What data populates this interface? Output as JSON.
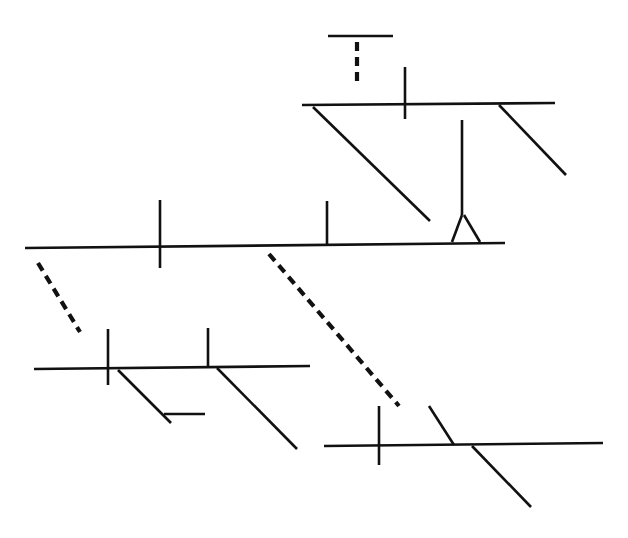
{
  "diagram": {
    "type": "sentence-diagram (Reed-Kellogg style, unlabeled)",
    "stroke_color": "#111111",
    "background": "#ffffff",
    "labels_visible": false,
    "segments": [
      {
        "id": "appositive-top-line",
        "style": "solid",
        "x1": 328,
        "y1": 36,
        "x2": 393,
        "y2": 36
      },
      {
        "id": "appositive-connector",
        "style": "dashed",
        "x1": 357,
        "y1": 42,
        "x2": 357,
        "y2": 84
      },
      {
        "id": "upper-clause-baseline",
        "style": "solid",
        "x1": 302,
        "y1": 105,
        "x2": 555,
        "y2": 103
      },
      {
        "id": "upper-clause-divider",
        "style": "solid",
        "x1": 405,
        "y1": 67,
        "x2": 405,
        "y2": 119
      },
      {
        "id": "upper-clause-modifier-left",
        "style": "solid",
        "x1": 313,
        "y1": 107,
        "x2": 430,
        "y2": 221
      },
      {
        "id": "upper-clause-modifier-right",
        "style": "solid",
        "x1": 499,
        "y1": 105,
        "x2": 566,
        "y2": 175
      },
      {
        "id": "pedestal-stem",
        "style": "solid",
        "x1": 462,
        "y1": 120,
        "x2": 462,
        "y2": 215
      },
      {
        "id": "pedestal-leg-left",
        "style": "solid",
        "x1": 462,
        "y1": 215,
        "x2": 452,
        "y2": 242
      },
      {
        "id": "pedestal-leg-right",
        "style": "solid",
        "x1": 464,
        "y1": 215,
        "x2": 480,
        "y2": 242
      },
      {
        "id": "main-baseline",
        "style": "solid",
        "x1": 25,
        "y1": 248,
        "x2": 505,
        "y2": 243
      },
      {
        "id": "main-subject-verb-divider",
        "style": "solid",
        "x1": 160,
        "y1": 200,
        "x2": 160,
        "y2": 268
      },
      {
        "id": "main-verb-complement-divider",
        "style": "solid",
        "x1": 327,
        "y1": 201,
        "x2": 327,
        "y2": 245
      },
      {
        "id": "connector-left",
        "style": "dashed",
        "x1": 38,
        "y1": 263,
        "x2": 80,
        "y2": 332
      },
      {
        "id": "connector-center",
        "style": "dashed",
        "x1": 269,
        "y1": 254,
        "x2": 399,
        "y2": 406
      },
      {
        "id": "lower-left-baseline",
        "style": "solid",
        "x1": 34,
        "y1": 369,
        "x2": 310,
        "y2": 366
      },
      {
        "id": "lower-left-subject-verb-divider",
        "style": "solid",
        "x1": 108,
        "y1": 329,
        "x2": 108,
        "y2": 385
      },
      {
        "id": "lower-left-verb-complement-divider",
        "style": "solid",
        "x1": 208,
        "y1": 328,
        "x2": 208,
        "y2": 367
      },
      {
        "id": "lower-left-modifier-a",
        "style": "solid",
        "x1": 118,
        "y1": 370,
        "x2": 171,
        "y2": 423
      },
      {
        "id": "lower-left-modifier-a-object",
        "style": "solid",
        "x1": 164,
        "y1": 414,
        "x2": 205,
        "y2": 414
      },
      {
        "id": "lower-left-modifier-b",
        "style": "solid",
        "x1": 217,
        "y1": 368,
        "x2": 297,
        "y2": 449
      },
      {
        "id": "lower-right-baseline",
        "style": "solid",
        "x1": 324,
        "y1": 446,
        "x2": 603,
        "y2": 443
      },
      {
        "id": "lower-right-subject-verb-divider",
        "style": "solid",
        "x1": 379,
        "y1": 406,
        "x2": 379,
        "y2": 465
      },
      {
        "id": "lower-right-slant-above",
        "style": "solid",
        "x1": 429,
        "y1": 406,
        "x2": 454,
        "y2": 445
      },
      {
        "id": "lower-right-modifier",
        "style": "solid",
        "x1": 472,
        "y1": 446,
        "x2": 531,
        "y2": 507
      }
    ]
  }
}
